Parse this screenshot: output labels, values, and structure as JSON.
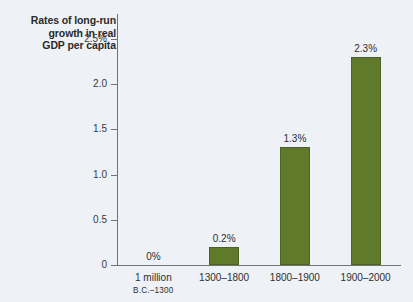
{
  "chart_data": {
    "type": "bar",
    "title": "Rates of long-run growth in real GDP per capita",
    "title_lines": [
      "Rates of long-run",
      "growth in real",
      "GDP per capita"
    ],
    "xlabel": "",
    "ylabel": "",
    "ylim": [
      0,
      2.5
    ],
    "grid": false,
    "legend": "none",
    "categories": [
      "1 million B.C.–1300",
      "1300–1800",
      "1800–1900",
      "1900–2000"
    ],
    "category_lines": [
      {
        "line1": "1 million",
        "line2": "B.C.–1300"
      },
      {
        "line1": "1300–1800",
        "line2": ""
      },
      {
        "line1": "1800–1900",
        "line2": ""
      },
      {
        "line1": "1900–2000",
        "line2": ""
      }
    ],
    "values": [
      0,
      0.2,
      1.3,
      2.3
    ],
    "value_labels": [
      "0%",
      "0.2%",
      "1.3%",
      "2.3%"
    ],
    "yticks": [
      0,
      0.5,
      1.0,
      1.5,
      2.0,
      2.5
    ],
    "ytick_labels": [
      "0",
      "0.5",
      "1.0",
      "1.5",
      "2.0",
      "2.5%"
    ],
    "bar_color": "#5e7a2a",
    "axis_color": "#6f7478",
    "background_color": "#eef1f5"
  }
}
